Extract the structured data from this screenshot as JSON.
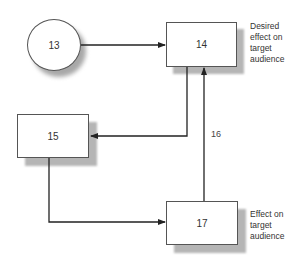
{
  "diagram": {
    "type": "flow",
    "nodes": [
      {
        "id": "13",
        "label": "13",
        "shape": "circle"
      },
      {
        "id": "14",
        "label": "14",
        "shape": "rectangle"
      },
      {
        "id": "15",
        "label": "15",
        "shape": "rectangle"
      },
      {
        "id": "17",
        "label": "17",
        "shape": "rectangle"
      }
    ],
    "edges": [
      {
        "from": "13",
        "to": "14",
        "label": ""
      },
      {
        "from": "14",
        "to": "15",
        "label": ""
      },
      {
        "from": "15",
        "to": "17",
        "label": ""
      },
      {
        "from": "17",
        "to": "14",
        "label": "16"
      }
    ],
    "annotations": {
      "node_14": "Desired effect on target audience",
      "node_17": "Effect on target audience"
    },
    "edge_label_16": "16"
  },
  "colors": {
    "line": "#222222",
    "node_border": "#555555",
    "shadow": "#b5b5b5",
    "text": "#333333"
  }
}
